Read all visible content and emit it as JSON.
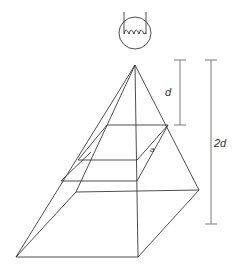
{
  "diagram": {
    "labels": {
      "short_distance": "d",
      "long_distance": "2d",
      "area_label": "a"
    },
    "elements": {
      "light_source": "bulb-with-filament",
      "pyramid_apex": [
        135,
        65
      ],
      "near_section": "area at distance d",
      "far_section": "base at distance 2d"
    }
  }
}
